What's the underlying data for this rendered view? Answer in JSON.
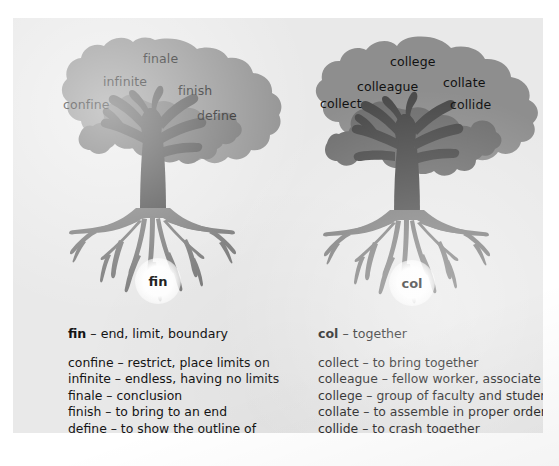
{
  "figure": {
    "panel_color": "#e9e9e9",
    "canopy_outer_color": "#8e8e8e",
    "canopy_inner_color": "#6f6f6f",
    "trunk_color": "#4a4a4a",
    "root_color": "#7b7b7b",
    "text_color": "#111111"
  },
  "trees": [
    {
      "root": "fin",
      "badge_label": "fin",
      "canopy_words": [
        {
          "text": "finale",
          "x": 143,
          "y": 53,
          "size": 13
        },
        {
          "text": "infinite",
          "x": 103,
          "y": 76,
          "size": 13
        },
        {
          "text": "finish",
          "x": 177,
          "y": 85,
          "size": 13
        },
        {
          "text": "confine",
          "x": 63,
          "y": 99,
          "size": 13
        },
        {
          "text": "define",
          "x": 196,
          "y": 110,
          "size": 13
        }
      ]
    },
    {
      "root": "col",
      "badge_label": "col",
      "canopy_words": [
        {
          "text": "college",
          "x": 390,
          "y": 56,
          "size": 13
        },
        {
          "text": "colleague",
          "x": 357,
          "y": 81,
          "size": 13
        },
        {
          "text": "collate",
          "x": 443,
          "y": 77,
          "size": 13
        },
        {
          "text": "collect",
          "x": 320,
          "y": 98,
          "size": 13
        },
        {
          "text": "collide",
          "x": 450,
          "y": 99,
          "size": 13
        }
      ]
    }
  ],
  "definitions": [
    {
      "root_term": "fin",
      "heading_gloss": "– end, limit, boundary",
      "entries": [
        "confine – restrict, place limits on",
        "infinite – endless, having no limits",
        "finale – conclusion",
        "finish – to bring to an end",
        "define – to show the outline of"
      ]
    },
    {
      "root_term": "col",
      "heading_gloss": "– together",
      "entries": [
        "collect – to bring together",
        "colleague – fellow worker, associate",
        "college – group of faculty and students",
        "collate – to assemble in proper order",
        "collide – to crash together"
      ]
    }
  ]
}
